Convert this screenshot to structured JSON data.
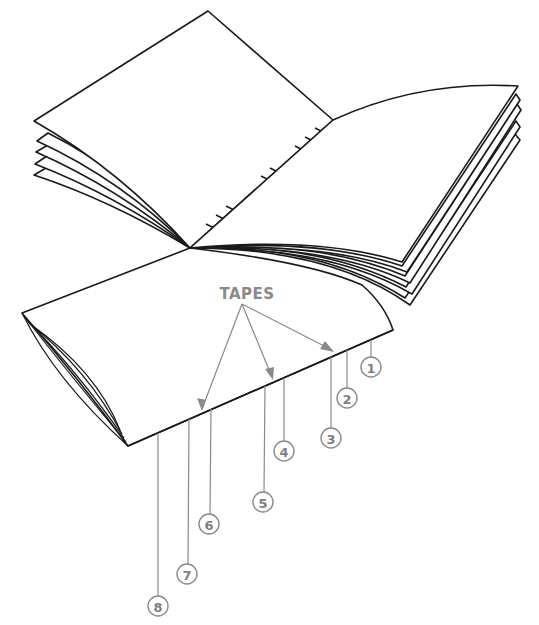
{
  "figure": {
    "tapes_label": "TAPES",
    "callouts": [
      {
        "number": "1",
        "cx": 370,
        "cy": 367,
        "anchor_x": 366,
        "anchor_y": 341
      },
      {
        "number": "2",
        "cx": 346,
        "cy": 398,
        "anchor_x": 346,
        "anchor_y": 351
      },
      {
        "number": "3",
        "cx": 330,
        "cy": 438,
        "anchor_x": 331,
        "anchor_y": 357
      },
      {
        "number": "4",
        "cx": 283,
        "cy": 451,
        "anchor_x": 283,
        "anchor_y": 380
      },
      {
        "number": "5",
        "cx": 263,
        "cy": 502,
        "anchor_x": 265,
        "anchor_y": 386
      },
      {
        "number": "6",
        "cx": 209,
        "cy": 524,
        "anchor_x": 210,
        "anchor_y": 411
      },
      {
        "number": "7",
        "cx": 187,
        "cy": 574,
        "anchor_x": 189,
        "anchor_y": 419
      },
      {
        "number": "8",
        "cx": 158,
        "cy": 606,
        "anchor_x": 158,
        "anchor_y": 434
      }
    ],
    "colors": {
      "line": "#1a1a1a",
      "annotation": "#8a8a8a",
      "background": "#ffffff"
    }
  }
}
